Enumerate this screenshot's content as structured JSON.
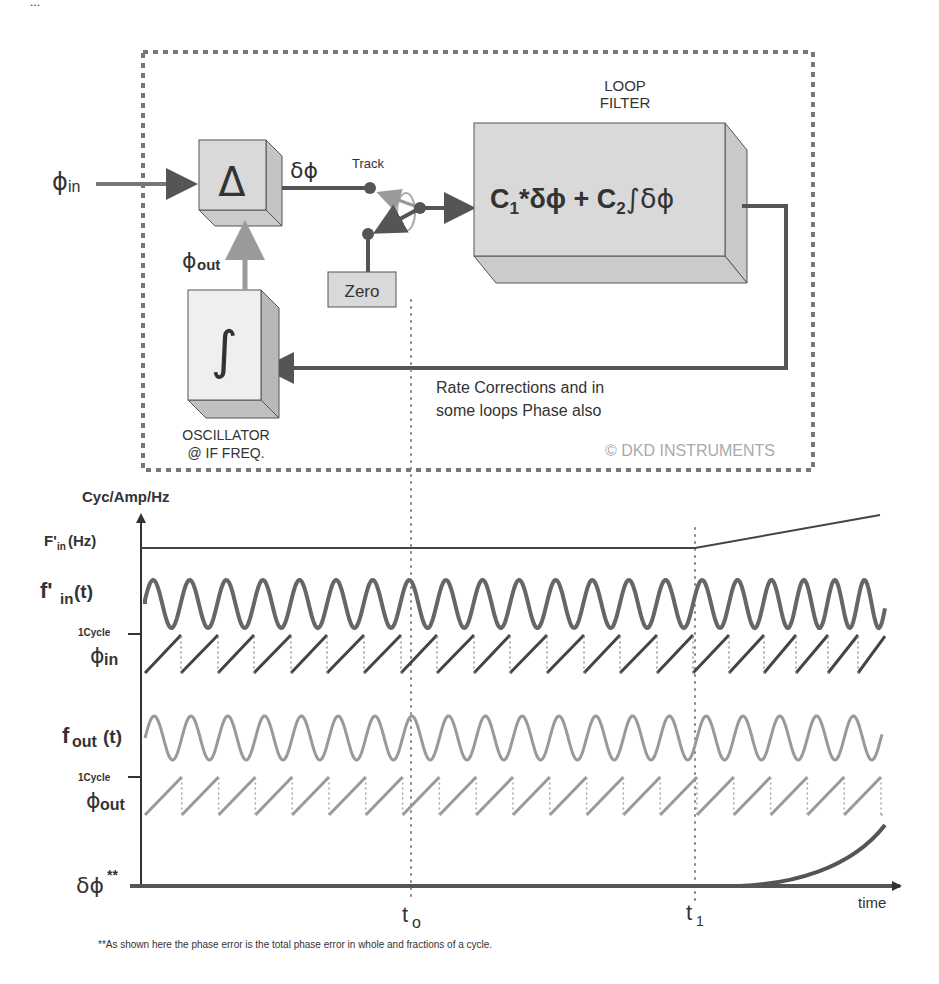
{
  "top_fragment": "...",
  "block_diagram": {
    "input_label": "ϕ",
    "input_sub": "in",
    "feedback_label": "ϕ",
    "feedback_sub": "out",
    "comparator_symbol": "Δ",
    "error_label": "δϕ",
    "switch_track_label": "Track",
    "switch_zero_label": "Zero",
    "loop_filter_title_1": "LOOP",
    "loop_filter_title_2": "FILTER",
    "loop_filter_eq": {
      "c1": "C",
      "c1_sub": "1",
      "term1": "*δϕ  +  ",
      "c2": "C",
      "c2_sub": "2",
      "term2": "∫δϕ"
    },
    "oscillator_symbol": "∫",
    "oscillator_label_1": "OSCILLATOR",
    "oscillator_label_2": "@ IF FREQ.",
    "feedback_note_1": "Rate Corrections and in",
    "feedback_note_2": "some loops Phase also",
    "copyright": "© DKD INSTRUMENTS",
    "colors": {
      "box_fill": "#d9d9d9",
      "box_side": "#c4c4c4",
      "line_dark": "#555555",
      "line_light": "#999999",
      "dash_border": "#777777"
    }
  },
  "timing_plot": {
    "y_axis_title": "Cyc/Amp/Hz",
    "x_axis_label": "time",
    "rows": [
      {
        "name": "F'",
        "sub": "in",
        "suffix": " (Hz)"
      },
      {
        "name": "f'",
        "sub": "in",
        "suffix": " (t)"
      },
      {
        "name": "ϕ",
        "sub": "in",
        "tick": "1Cycle"
      },
      {
        "name": "f",
        "sub": "out",
        "suffix": "(t)"
      },
      {
        "name": "ϕ",
        "sub": "out",
        "tick": "1Cycle"
      },
      {
        "name": "δϕ",
        "sup": "**"
      }
    ],
    "markers": [
      {
        "label": "t",
        "sub": "o"
      },
      {
        "label": "t",
        "sub": "1"
      }
    ],
    "footnote": "**As shown here the phase error is the total phase error in whole and fractions of a cycle."
  },
  "chart_data": {
    "type": "line",
    "xlabel": "time",
    "ylabel": "Cyc/Amp/Hz",
    "series": [
      {
        "name": "F'in (Hz)",
        "description": "constant until t1, then ramps upward linearly"
      },
      {
        "name": "f'in (t)",
        "description": "sinusoid, ~17 cycles; frequency increases after t1"
      },
      {
        "name": "ϕin",
        "description": "sawtooth 0→1 cycle, resets each period; period shrinks after t1"
      },
      {
        "name": "fout(t)",
        "description": "sinusoid at constant frequency, ~17 cycles"
      },
      {
        "name": "ϕout",
        "description": "sawtooth 0→1 cycle at constant rate"
      },
      {
        "name": "δϕ**",
        "description": "zero until shortly after t1, then rises exponentially"
      }
    ],
    "annotations": [
      "t0",
      "t1"
    ]
  }
}
